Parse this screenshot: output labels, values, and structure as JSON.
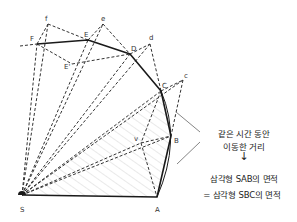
{
  "diagram": {
    "points": {
      "S": {
        "label": "S",
        "x": 22,
        "y": 195
      },
      "A": {
        "label": "A",
        "x": 157,
        "y": 197
      },
      "B": {
        "label": "B",
        "x": 171,
        "y": 136
      },
      "C": {
        "label": "C",
        "x": 161,
        "y": 91
      },
      "D": {
        "label": "D",
        "x": 130,
        "y": 54
      },
      "E": {
        "label": "E",
        "x": 88,
        "y": 40
      },
      "F": {
        "label": "F",
        "x": 37,
        "y": 44
      },
      "c": {
        "label": "c",
        "x": 183,
        "y": 80
      },
      "d": {
        "label": "d",
        "x": 150,
        "y": 44
      },
      "e": {
        "label": "e",
        "x": 103,
        "y": 24
      },
      "f": {
        "label": "f",
        "x": 48,
        "y": 24
      },
      "v": {
        "label": "v",
        "x": 141,
        "y": 143
      },
      "Eprime": {
        "label": "E'",
        "x": 72,
        "y": 64
      }
    },
    "path_solid": [
      "S",
      "A",
      "B",
      "C",
      "D",
      "E",
      "F"
    ],
    "annotation": {
      "line1": "같은 시간 동안",
      "line2": "이동한 거리",
      "arrow": "↓",
      "line3": "삼각형 SAB의 면적",
      "line4": "= 삼각형 SBC의 면적"
    },
    "colors": {
      "line": "#1a1a1a",
      "dashed": "#333333",
      "hatch": "#c8c8c8",
      "leader": "#666666"
    }
  }
}
